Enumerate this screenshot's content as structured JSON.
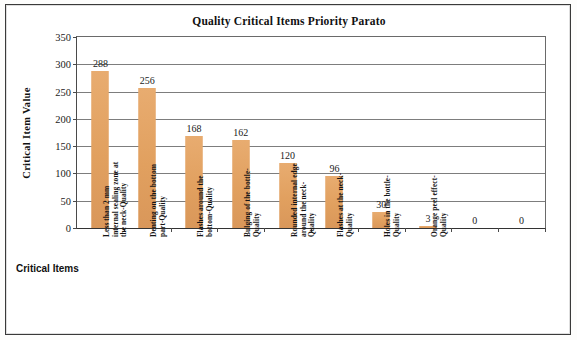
{
  "chart_data": {
    "type": "bar",
    "title": "Quality Critical Items Priority Parato",
    "xlabel": "Critical Items",
    "ylabel": "Critical Item Value",
    "ylim": [
      0,
      350
    ],
    "ytick_step": 50,
    "yticks": [
      "350",
      "300",
      "250",
      "200",
      "150",
      "100",
      "50",
      "0"
    ],
    "grid": true,
    "legend": "none",
    "bar_color": "#E3A264",
    "categories": [
      "Less than 2 mm\ninternal sealing zone at\nthe neck-Quality",
      "Denting on the bottom\npart-Quality",
      "Flashes around the\nbottom-Quality",
      "Bulging of the bottle-\nQuality",
      "Rounded internal edge\naround the neck-\nQuality",
      "Flashes at the neck-\nQuality",
      "Holes in the bottle-\nQuality",
      "Orange peel effect-\nQuality",
      "",
      ""
    ],
    "values": [
      288,
      256,
      168,
      162,
      120,
      96,
      30,
      3,
      0,
      0
    ],
    "data_labels": [
      "288",
      "256",
      "168",
      "162",
      "120",
      "96",
      "30",
      "3",
      "0",
      "0"
    ]
  }
}
